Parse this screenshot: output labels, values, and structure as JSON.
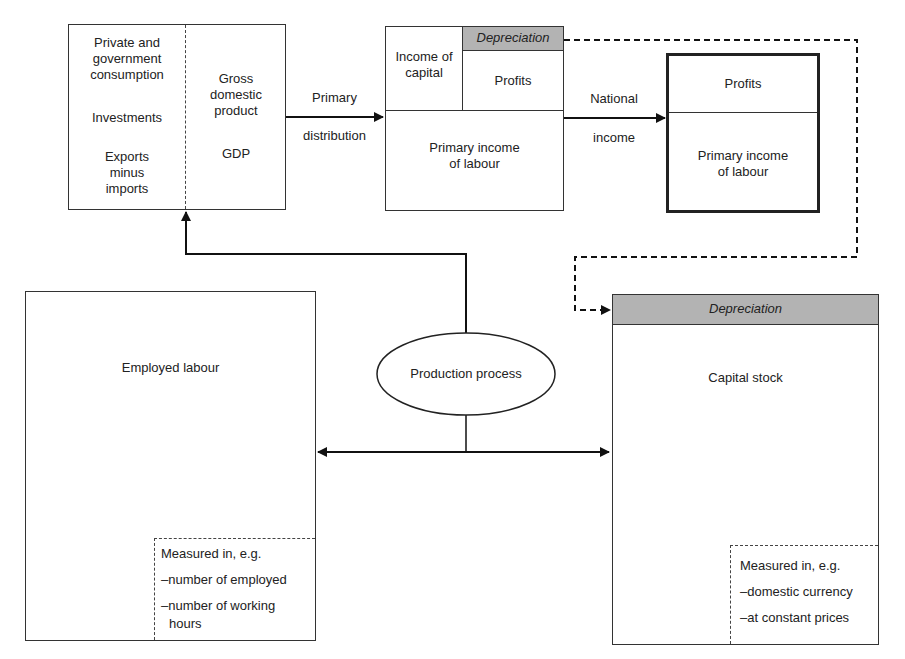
{
  "diagram": {
    "gdp_box": {
      "left_items": [
        "Private and government consumption",
        "Investments",
        "Exports minus imports"
      ],
      "left_lines": {
        "consumption": [
          "Private and",
          "government",
          "consumption"
        ],
        "investments": "Investments",
        "exports": [
          "Exports",
          "minus",
          "imports"
        ]
      },
      "right_lines": [
        "Gross",
        "domestic",
        "product"
      ],
      "abbrev": "GDP"
    },
    "primary_distribution_arrow": {
      "label_top": "Primary",
      "label_bottom": "distribution"
    },
    "primary_income_box": {
      "income_of_capital": [
        "Income of",
        "capital"
      ],
      "depreciation": "Depreciation",
      "profits": "Profits",
      "primary_income_of_labour": [
        "Primary income",
        "of labour"
      ]
    },
    "national_income_arrow": {
      "label_top": "National",
      "label_bottom": "income"
    },
    "national_income_box": {
      "profits": "Profits",
      "primary_income_of_labour": [
        "Primary income",
        "of labour"
      ]
    },
    "production_process": {
      "label": "Production process"
    },
    "employed_labour_box": {
      "title": "Employed labour",
      "measured": {
        "heading": "Measured in, e.g.",
        "items": [
          "–number of employed",
          "–number of working",
          "hours"
        ]
      }
    },
    "capital_stock_box": {
      "depreciation": "Depreciation",
      "title": "Capital stock",
      "measured": {
        "heading": "Measured in, e.g.",
        "items": [
          "–domestic currency",
          "–at constant prices"
        ]
      }
    },
    "colors": {
      "line": "#222222",
      "depreciation_fill": "#b3b3b3",
      "background": "#ffffff"
    }
  }
}
